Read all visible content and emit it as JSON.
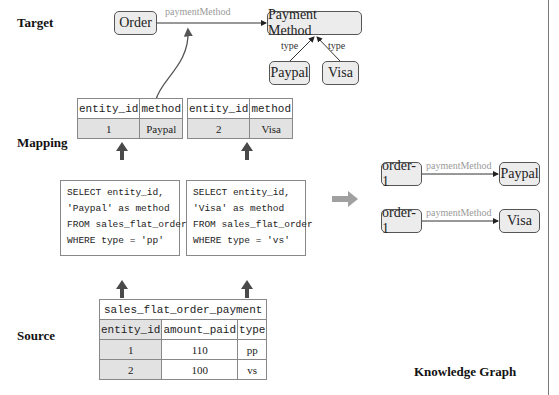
{
  "layers": {
    "target": "Target",
    "mapping": "Mapping",
    "source": "Source",
    "knowledge_graph": "Knowledge Graph"
  },
  "ontology": {
    "order": "Order",
    "payment_method": "Payment Method",
    "edge_payment": "paymentMethod",
    "paypal": "Paypal",
    "visa": "Visa",
    "type_left": "type",
    "type_right": "type"
  },
  "mapping_results": [
    {
      "headers": [
        "entity_id",
        "method"
      ],
      "row": [
        "1",
        "Paypal"
      ]
    },
    {
      "headers": [
        "entity_id",
        "method"
      ],
      "row": [
        "2",
        "Visa"
      ]
    }
  ],
  "sql": [
    {
      "lines": [
        "SELECT entity_id,",
        "'Paypal' as method",
        "FROM sales_flat_order",
        "WHERE type = 'pp'"
      ]
    },
    {
      "lines": [
        "SELECT entity_id,",
        "'Visa' as method",
        "FROM sales_flat_order",
        "WHERE type = 'vs'"
      ]
    }
  ],
  "source_table": {
    "name": "sales_flat_order_payment",
    "headers": [
      "entity_id",
      "amount_paid",
      "type"
    ],
    "rows": [
      [
        "1",
        "110",
        "pp"
      ],
      [
        "2",
        "100",
        "vs"
      ]
    ]
  },
  "kg": [
    {
      "subject": "order-1",
      "predicate": "paymentMethod",
      "object": "Paypal"
    },
    {
      "subject": "order-1",
      "predicate": "paymentMethod",
      "object": "Visa"
    }
  ],
  "colors": {
    "node_fill": "#ececec",
    "arrow_grey": "#a0a0a0",
    "edge_label": "#9a9a9a",
    "cell_grey": "#e2e2e2"
  }
}
